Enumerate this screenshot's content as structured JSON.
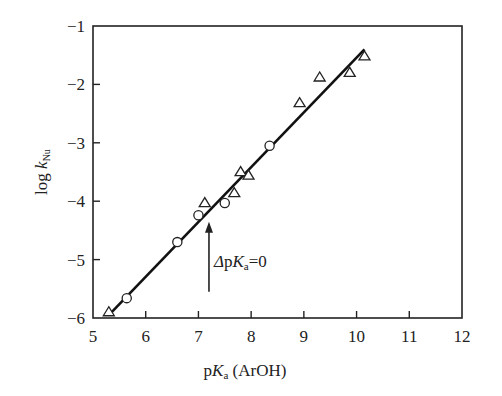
{
  "chart_data": {
    "type": "scatter",
    "title": "",
    "xlabel": "pKa (ArOH)",
    "ylabel": "log kNu",
    "xlim": [
      5,
      12
    ],
    "ylim": [
      -6,
      -1
    ],
    "x_ticks": [
      5,
      6,
      7,
      8,
      9,
      10,
      11,
      12
    ],
    "y_ticks": [
      -1,
      -2,
      -3,
      -4,
      -5,
      -6
    ],
    "grid": false,
    "legend": null,
    "series": [
      {
        "name": "triangles",
        "marker": "triangle",
        "points": [
          [
            5.3,
            -5.9
          ],
          [
            7.12,
            -4.03
          ],
          [
            7.68,
            -3.86
          ],
          [
            7.8,
            -3.5
          ],
          [
            7.95,
            -3.56
          ],
          [
            8.92,
            -2.32
          ],
          [
            9.3,
            -1.88
          ],
          [
            9.87,
            -1.8
          ],
          [
            10.15,
            -1.52
          ]
        ]
      },
      {
        "name": "circles",
        "marker": "circle",
        "points": [
          [
            5.64,
            -5.66
          ],
          [
            6.6,
            -4.7
          ],
          [
            7.0,
            -4.24
          ],
          [
            7.5,
            -4.03
          ],
          [
            8.35,
            -3.05
          ]
        ]
      }
    ],
    "fit_line": {
      "x": [
        5.3,
        10.15
      ],
      "y": [
        -5.95,
        -1.4
      ]
    },
    "annotations": [
      {
        "text": "ΔpKa=0",
        "arrow_x": 7.2,
        "arrow_from_y": -5.55,
        "arrow_to_y": -4.35
      }
    ]
  },
  "labels": {
    "ylabel_main": "log ",
    "ylabel_k": "k",
    "ylabel_sub": "Nu",
    "xlabel_main": "p",
    "xlabel_k": "K",
    "xlabel_sub": "a",
    "xlabel_rest": " (ArOH)",
    "annot_delta": "Δ",
    "annot_p": "p",
    "annot_k": "K",
    "annot_sub": "a",
    "annot_rest": "=0"
  }
}
